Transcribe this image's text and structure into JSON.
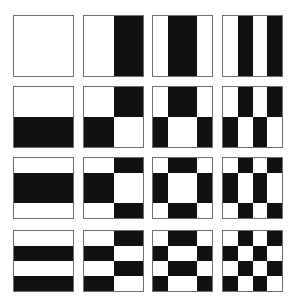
{
  "diagram": {
    "colors": {
      "black": "#111111",
      "white": "#ffffff",
      "border": "#6e6e6e"
    },
    "basis_vectors": {
      "A": [
        0,
        0,
        0,
        0
      ],
      "B": [
        0,
        0,
        1,
        1
      ],
      "C": [
        0,
        1,
        1,
        0
      ],
      "D": [
        0,
        1,
        0,
        1
      ]
    },
    "row_order": [
      "A",
      "B",
      "C",
      "D"
    ],
    "col_order": [
      "A",
      "B",
      "C",
      "D"
    ],
    "layout": {
      "x": [
        13,
        83,
        152,
        222
      ],
      "y": [
        15,
        86,
        157,
        230
      ]
    }
  }
}
